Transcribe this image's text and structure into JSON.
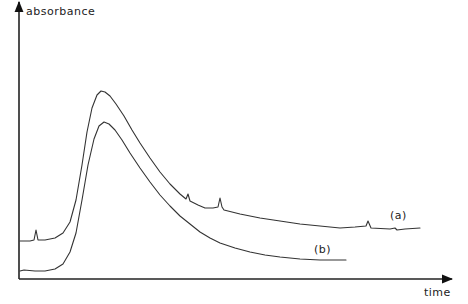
{
  "chart_data": {
    "type": "line",
    "title": "",
    "xlabel": "time",
    "ylabel": "absorbance",
    "grid": false,
    "legend": "inline labels at curve ends",
    "axis_ticks": "none",
    "series": [
      {
        "name": "(a)",
        "label_pos": [
          390,
          219
        ],
        "points": [
          [
            20,
            241
          ],
          [
            30,
            241
          ],
          [
            34,
            240
          ],
          [
            36,
            230
          ],
          [
            38,
            240
          ],
          [
            45,
            240
          ],
          [
            55,
            238
          ],
          [
            63,
            233
          ],
          [
            70,
            222
          ],
          [
            76,
            200
          ],
          [
            82,
            165
          ],
          [
            87,
            132
          ],
          [
            92,
            108
          ],
          [
            97,
            95
          ],
          [
            101,
            91
          ],
          [
            105,
            92
          ],
          [
            110,
            96
          ],
          [
            116,
            104
          ],
          [
            124,
            116
          ],
          [
            132,
            130
          ],
          [
            140,
            143
          ],
          [
            150,
            158
          ],
          [
            160,
            172
          ],
          [
            170,
            184
          ],
          [
            180,
            194
          ],
          [
            186,
            199
          ],
          [
            188,
            194
          ],
          [
            190,
            201
          ],
          [
            198,
            205
          ],
          [
            205,
            208
          ],
          [
            213,
            208
          ],
          [
            218,
            207
          ],
          [
            220,
            198
          ],
          [
            222,
            207
          ],
          [
            224,
            210
          ],
          [
            240,
            214
          ],
          [
            260,
            218
          ],
          [
            280,
            221
          ],
          [
            300,
            224
          ],
          [
            320,
            226
          ],
          [
            340,
            228
          ],
          [
            355,
            227
          ],
          [
            366,
            226
          ],
          [
            368,
            221
          ],
          [
            371,
            228
          ],
          [
            390,
            229
          ],
          [
            395,
            228
          ],
          [
            397,
            230
          ],
          [
            405,
            229
          ],
          [
            420,
            228
          ]
        ]
      },
      {
        "name": "(b)",
        "label_pos": [
          314,
          253
        ],
        "points": [
          [
            20,
            271
          ],
          [
            24,
            270
          ],
          [
            35,
            271
          ],
          [
            45,
            271
          ],
          [
            55,
            269
          ],
          [
            63,
            264
          ],
          [
            70,
            252
          ],
          [
            76,
            233
          ],
          [
            82,
            200
          ],
          [
            88,
            165
          ],
          [
            94,
            139
          ],
          [
            99,
            126
          ],
          [
            104,
            122
          ],
          [
            109,
            124
          ],
          [
            115,
            130
          ],
          [
            122,
            140
          ],
          [
            130,
            153
          ],
          [
            140,
            168
          ],
          [
            150,
            182
          ],
          [
            160,
            195
          ],
          [
            170,
            206
          ],
          [
            180,
            216
          ],
          [
            190,
            224
          ],
          [
            200,
            232
          ],
          [
            210,
            238
          ],
          [
            220,
            243
          ],
          [
            235,
            248
          ],
          [
            250,
            252
          ],
          [
            265,
            255
          ],
          [
            280,
            257
          ],
          [
            300,
            259
          ],
          [
            320,
            260
          ],
          [
            346,
            260
          ]
        ]
      }
    ],
    "x_axis": {
      "from": [
        19,
        279
      ],
      "to": [
        452,
        279
      ]
    },
    "y_axis": {
      "from": [
        19,
        279
      ],
      "to": [
        19,
        2
      ]
    }
  },
  "labels": {
    "ylabel": "absorbance",
    "xlabel": "time",
    "series_a": "(a)",
    "series_b": "(b)"
  }
}
